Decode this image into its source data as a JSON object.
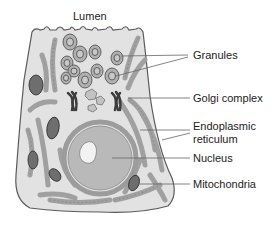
{
  "diagram": {
    "title_label": "Lumen",
    "labels": [
      {
        "id": "granules",
        "text": "Granules"
      },
      {
        "id": "golgi",
        "text": "Golgi complex"
      },
      {
        "id": "er_line1",
        "text": "Endoplasmic"
      },
      {
        "id": "er_line2",
        "text": "reticulum"
      },
      {
        "id": "nucleus",
        "text": "Nucleus"
      },
      {
        "id": "mitochondria",
        "text": "Mitochondria"
      }
    ],
    "colors": {
      "cell_fill": "#e2e2e2",
      "cell_stroke": "#5a5a5a",
      "organelle_fill": "#a8a8a8",
      "nucleus_fill": "#b9b9b9",
      "nucleolus_fill": "#f2f2f2",
      "golgi_fill": "#3c3c3c",
      "leader_line": "#666666"
    }
  }
}
